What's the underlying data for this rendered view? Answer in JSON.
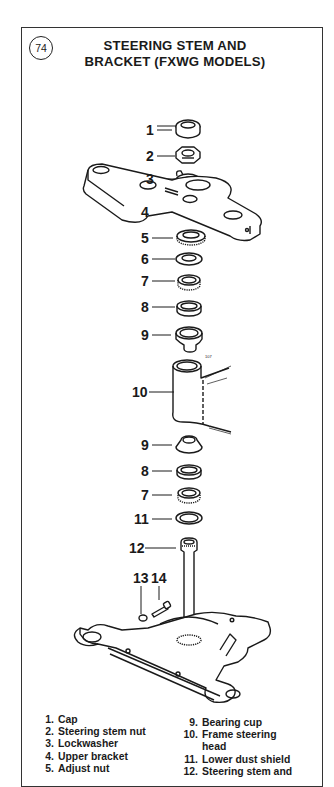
{
  "figure": {
    "number": "74",
    "title_line1": "STEERING STEM AND",
    "title_line2": "BRACKET (FXWG MODELS)"
  },
  "callouts": [
    {
      "label": "1",
      "x": 148,
      "y": 134
    },
    {
      "label": "2",
      "x": 148,
      "y": 162
    },
    {
      "label": "3",
      "x": 148,
      "y": 185
    },
    {
      "label": "4",
      "x": 143,
      "y": 217
    },
    {
      "label": "5",
      "x": 143,
      "y": 243
    },
    {
      "label": "6",
      "x": 143,
      "y": 264
    },
    {
      "label": "7",
      "x": 143,
      "y": 286
    },
    {
      "label": "8",
      "x": 143,
      "y": 312
    },
    {
      "label": "9",
      "x": 143,
      "y": 339
    },
    {
      "label": "10",
      "x": 135,
      "y": 397
    },
    {
      "label": "9",
      "x": 143,
      "y": 450
    },
    {
      "label": "8",
      "x": 143,
      "y": 476
    },
    {
      "label": "7",
      "x": 143,
      "y": 500
    },
    {
      "label": "11",
      "x": 137,
      "y": 524
    },
    {
      "label": "12",
      "x": 131,
      "y": 553
    },
    {
      "label": "13",
      "x": 134,
      "y": 580
    },
    {
      "label": "14",
      "x": 152,
      "y": 580
    }
  ],
  "legend": {
    "left": [
      {
        "num": "1.",
        "text": "Cap"
      },
      {
        "num": "2.",
        "text": "Steering stem nut"
      },
      {
        "num": "3.",
        "text": "Lockwasher"
      },
      {
        "num": "4.",
        "text": "Upper bracket"
      },
      {
        "num": "5.",
        "text": "Adjust nut"
      }
    ],
    "right": [
      {
        "num": "9.",
        "text": "Bearing cup"
      },
      {
        "num": "10.",
        "text": "Frame steering",
        "cont": "head"
      },
      {
        "num": "11.",
        "text": "Lower dust shield"
      },
      {
        "num": "12.",
        "text": "Steering stem and"
      }
    ]
  },
  "colors": {
    "ink": "#1a1a1a",
    "paper": "#ffffff",
    "border": "#333333"
  }
}
